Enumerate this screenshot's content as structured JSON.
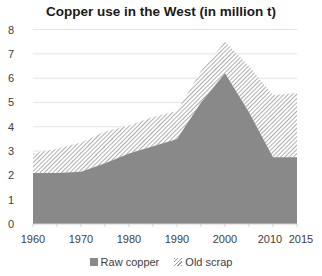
{
  "chart_data": {
    "type": "area",
    "stacked": true,
    "title": "Copper use in the West (in million t)",
    "xlabel": "",
    "ylabel": "",
    "x": [
      1960,
      1965,
      1970,
      1975,
      1980,
      1985,
      1990,
      1995,
      2000,
      2005,
      2010,
      2015
    ],
    "x_tick_labels": [
      "1960",
      "1970",
      "1980",
      "1990",
      "2000",
      "2010",
      "2015"
    ],
    "y_tick_labels": [
      "0",
      "1",
      "2",
      "3",
      "4",
      "5",
      "6",
      "7",
      "8"
    ],
    "ylim": [
      0,
      8
    ],
    "xlim": [
      1960,
      2015
    ],
    "grid": true,
    "legend_position": "bottom",
    "series": [
      {
        "name": "Raw copper",
        "fill": "solid",
        "color": "#898989",
        "values": [
          2.1,
          2.1,
          2.15,
          2.5,
          2.9,
          3.2,
          3.5,
          5.0,
          6.2,
          4.6,
          2.75,
          2.75
        ]
      },
      {
        "name": "Old scrap",
        "fill": "hatched",
        "color": "#9a9a9a",
        "values": [
          0.8,
          1.0,
          1.2,
          1.3,
          1.15,
          1.2,
          1.15,
          1.3,
          1.3,
          1.9,
          2.55,
          2.65
        ]
      }
    ],
    "totals": [
      2.9,
      3.1,
      3.35,
      3.8,
      4.05,
      4.4,
      4.65,
      6.3,
      7.5,
      6.5,
      5.3,
      5.4
    ]
  },
  "legend": {
    "raw_copper": "Raw copper",
    "old_scrap": "Old scrap"
  }
}
